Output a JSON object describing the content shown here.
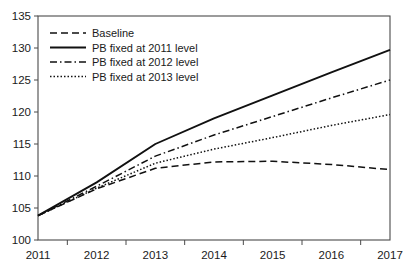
{
  "chart_data": {
    "type": "line",
    "title": "",
    "subtitle": "",
    "xlabel": "",
    "ylabel": "",
    "x": [
      2011,
      2012,
      2013,
      2014,
      2015,
      2016,
      2017
    ],
    "xtick_labels": [
      "2011",
      "2012",
      "2013",
      "2014",
      "2015",
      "2016",
      "2017"
    ],
    "ytick_labels": [
      "100",
      "105",
      "110",
      "115",
      "120",
      "125",
      "130",
      "135"
    ],
    "ytick_values": [
      100,
      105,
      110,
      115,
      120,
      125,
      130,
      135
    ],
    "xlim": [
      2011,
      2017
    ],
    "ylim": [
      100,
      135
    ],
    "grid": false,
    "legend_position": "top-left",
    "series": [
      {
        "name": "Baseline",
        "style": "dashed",
        "color": "#111111",
        "values": [
          103.8,
          108.0,
          111.2,
          112.2,
          112.3,
          111.8,
          111.0
        ]
      },
      {
        "name": "PB fixed at 2011 level",
        "style": "solid",
        "color": "#111111",
        "values": [
          103.8,
          109.0,
          115.0,
          119.0,
          122.6,
          126.2,
          129.7
        ]
      },
      {
        "name": "PB fixed at 2012 level",
        "style": "dashdot",
        "color": "#111111",
        "values": [
          103.8,
          108.4,
          113.1,
          116.4,
          119.3,
          122.2,
          125.0
        ]
      },
      {
        "name": "PB fixed at 2013 level",
        "style": "dotted",
        "color": "#111111",
        "values": [
          103.8,
          108.1,
          112.0,
          114.2,
          116.0,
          117.9,
          119.6
        ]
      }
    ]
  }
}
